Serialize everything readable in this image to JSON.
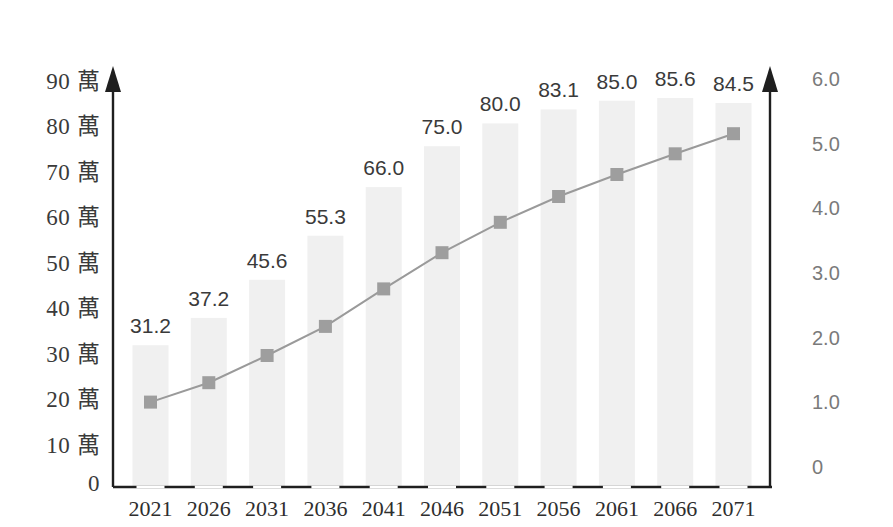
{
  "chart_data": {
    "type": "bar",
    "title": "",
    "subtitle": "",
    "xlabel": "",
    "ylabel": "",
    "grid": false,
    "legend": "none",
    "categories": [
      "2021",
      "2026",
      "2031",
      "2036",
      "2041",
      "2046",
      "2051",
      "2056",
      "2061",
      "2066",
      "2071"
    ],
    "series": [
      {
        "name": "bars",
        "type": "bar",
        "axis": "left",
        "unit": "萬",
        "values": [
          31.2,
          37.2,
          45.6,
          55.3,
          66.0,
          75.0,
          80.0,
          83.1,
          85.0,
          85.6,
          84.5
        ],
        "labels": [
          "31.2",
          "37.2",
          "45.6",
          "55.3",
          "66.0",
          "75.0",
          "80.0",
          "83.1",
          "85.0",
          "85.6",
          "84.5"
        ],
        "color": "#f0f0f0"
      },
      {
        "name": "line",
        "type": "line",
        "axis": "right",
        "values": [
          1.05,
          1.35,
          1.77,
          2.22,
          2.8,
          3.36,
          3.83,
          4.23,
          4.57,
          4.89,
          5.2
        ],
        "color": "#9a9a9a",
        "marker": "square"
      }
    ],
    "left_axis": {
      "ticks": [
        "90 萬",
        "80 萬",
        "70 萬",
        "60 萬",
        "50 萬",
        "40 萬",
        "30 萬",
        "20 萬",
        "10 萬",
        "0"
      ],
      "values": [
        90,
        80,
        70,
        60,
        50,
        40,
        30,
        20,
        10,
        0
      ],
      "unit": "萬",
      "ylim": [
        0,
        90
      ]
    },
    "right_axis": {
      "ticks": [
        "6.0",
        "5.0",
        "4.0",
        "3.0",
        "2.0",
        "1.0",
        "0"
      ],
      "values": [
        6.0,
        5.0,
        4.0,
        3.0,
        2.0,
        1.0,
        0
      ],
      "ylim": [
        0,
        6.0
      ]
    },
    "colors": {
      "bar": "#f0f0f0",
      "line": "#9a9a9a",
      "marker": "#9e9e9e",
      "axis": "#1f1f1f",
      "label_text": "#3a3a3a",
      "right_tick_text": "#7a7a7a"
    }
  }
}
